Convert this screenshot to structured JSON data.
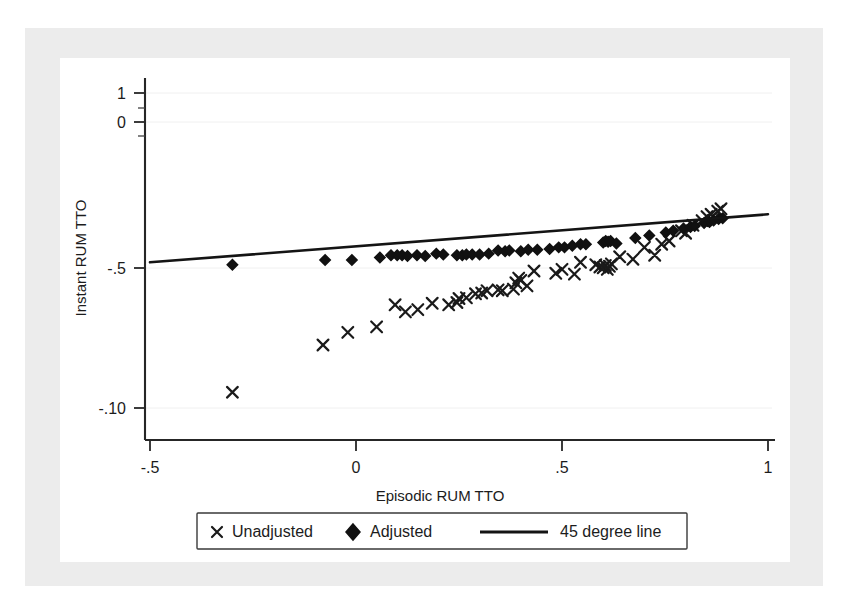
{
  "figure": {
    "background_color": "#ffffff",
    "frame_color": "#ececec",
    "marker_color": "#1a1a1a",
    "line_color": "#141414"
  },
  "chart_data": {
    "type": "scatter",
    "title": "",
    "xlabel": "Episodic RUM TTO",
    "ylabel": "Instant RUM TTO",
    "xlim": [
      -0.5,
      1.0
    ],
    "ylim": [
      -1.0,
      1.0
    ],
    "xticks": [
      -0.5,
      0,
      0.5,
      1
    ],
    "xtick_labels": [
      "-.5",
      "0",
      ".5",
      "1"
    ],
    "yticks": [
      1.0,
      0.0,
      -0.5,
      -1.0
    ],
    "ytick_labels": [
      "1",
      "0",
      "-.5",
      "-.10"
    ],
    "grid": "light horizontal gridlines at y ticks",
    "legend_position": "below axis, centered, boxed",
    "legend": [
      {
        "marker": "x",
        "label": "Unadjusted"
      },
      {
        "marker": "diamond",
        "label": "Adjusted"
      },
      {
        "marker": "line",
        "label": "45 degree line"
      }
    ],
    "series": [
      {
        "name": "Unadjusted",
        "marker": "x",
        "points": [
          [
            -0.3,
            -0.9
          ],
          [
            -0.08,
            -0.6
          ],
          [
            -0.02,
            -0.52
          ],
          [
            0.05,
            -0.485
          ],
          [
            0.095,
            -0.345
          ],
          [
            0.12,
            -0.39
          ],
          [
            0.15,
            -0.375
          ],
          [
            0.185,
            -0.335
          ],
          [
            0.225,
            -0.345
          ],
          [
            0.245,
            -0.33
          ],
          [
            0.25,
            -0.305
          ],
          [
            0.268,
            -0.3
          ],
          [
            0.29,
            -0.275
          ],
          [
            0.305,
            -0.27
          ],
          [
            0.318,
            -0.255
          ],
          [
            0.345,
            -0.25
          ],
          [
            0.355,
            -0.255
          ],
          [
            0.382,
            -0.245
          ],
          [
            0.388,
            -0.205
          ],
          [
            0.395,
            -0.175
          ],
          [
            0.4,
            -0.19
          ],
          [
            0.415,
            -0.225
          ],
          [
            0.432,
            -0.13
          ],
          [
            0.485,
            -0.145
          ],
          [
            0.5,
            -0.12
          ],
          [
            0.53,
            -0.15
          ],
          [
            0.545,
            -0.075
          ],
          [
            0.582,
            -0.09
          ],
          [
            0.592,
            -0.105
          ],
          [
            0.6,
            -0.11
          ],
          [
            0.605,
            -0.095
          ],
          [
            0.61,
            -0.12
          ],
          [
            0.615,
            -0.1
          ],
          [
            0.62,
            -0.085
          ],
          [
            0.64,
            -0.04
          ],
          [
            0.672,
            -0.055
          ],
          [
            0.7,
            0.02
          ],
          [
            0.725,
            -0.03
          ],
          [
            0.742,
            0.04
          ],
          [
            0.76,
            0.06
          ],
          [
            0.79,
            0.125
          ],
          [
            0.8,
            0.11
          ],
          [
            0.818,
            0.16
          ],
          [
            0.84,
            0.19
          ],
          [
            0.852,
            0.215
          ],
          [
            0.862,
            0.23
          ],
          [
            0.878,
            0.25
          ],
          [
            0.886,
            0.265
          ]
        ]
      },
      {
        "name": "Adjusted",
        "marker": "diamond",
        "points": [
          [
            -0.3,
            -0.09
          ],
          [
            -0.075,
            -0.06
          ],
          [
            -0.01,
            -0.06
          ],
          [
            0.058,
            -0.045
          ],
          [
            0.085,
            -0.03
          ],
          [
            0.1,
            -0.03
          ],
          [
            0.112,
            -0.03
          ],
          [
            0.125,
            -0.035
          ],
          [
            0.148,
            -0.03
          ],
          [
            0.168,
            -0.035
          ],
          [
            0.195,
            -0.02
          ],
          [
            0.212,
            -0.025
          ],
          [
            0.245,
            -0.03
          ],
          [
            0.258,
            -0.03
          ],
          [
            0.268,
            -0.025
          ],
          [
            0.282,
            -0.025
          ],
          [
            0.3,
            -0.025
          ],
          [
            0.322,
            -0.02
          ],
          [
            0.345,
            0.0
          ],
          [
            0.362,
            -0.005
          ],
          [
            0.372,
            0.0
          ],
          [
            0.4,
            -0.005
          ],
          [
            0.418,
            0.005
          ],
          [
            0.44,
            0.005
          ],
          [
            0.47,
            0.01
          ],
          [
            0.492,
            0.02
          ],
          [
            0.506,
            0.02
          ],
          [
            0.525,
            0.03
          ],
          [
            0.545,
            0.04
          ],
          [
            0.558,
            0.04
          ],
          [
            0.6,
            0.05
          ],
          [
            0.606,
            0.06
          ],
          [
            0.612,
            0.055
          ],
          [
            0.618,
            0.06
          ],
          [
            0.632,
            0.045
          ],
          [
            0.678,
            0.08
          ],
          [
            0.712,
            0.095
          ],
          [
            0.752,
            0.115
          ],
          [
            0.77,
            0.125
          ],
          [
            0.795,
            0.14
          ],
          [
            0.812,
            0.15
          ],
          [
            0.822,
            0.155
          ],
          [
            0.845,
            0.175
          ],
          [
            0.858,
            0.18
          ],
          [
            0.868,
            0.19
          ],
          [
            0.88,
            0.2
          ],
          [
            0.89,
            0.205
          ]
        ]
      }
    ],
    "reference_line": {
      "name": "45 degree line",
      "x_start": -0.5,
      "y_start": -0.075,
      "x_end": 1.0,
      "y_end": 0.23
    }
  }
}
